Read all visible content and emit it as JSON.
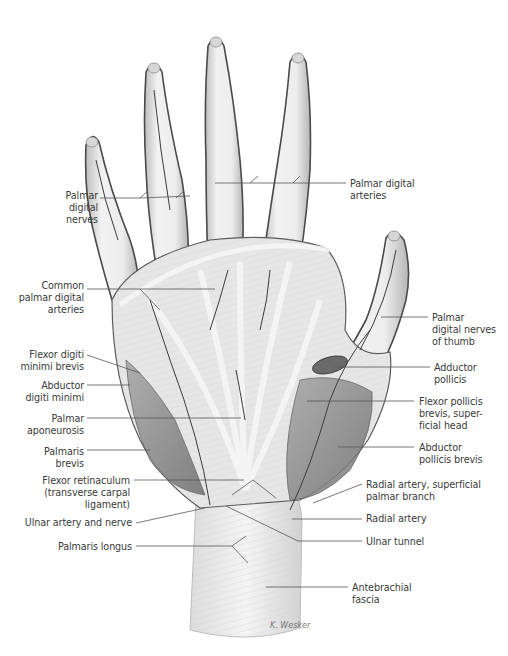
{
  "figure": {
    "type": "anatomical-illustration",
    "signature": "K. Wesker",
    "colors": {
      "label_text": "#3a3a3a",
      "leader_line": "#555555",
      "skin_tendon": "#e9e9e9",
      "outline": "#4a4a4a",
      "muscle": "#8c8c8c",
      "vessel": "#3d3d3d"
    }
  },
  "labels": {
    "left": [
      {
        "id": "palmar-digital-nerves",
        "text": "Palmar\ndigital\nnerves",
        "x": 30,
        "y": 190,
        "w": 68
      },
      {
        "id": "common-palmar-digital-arteries",
        "text": "Common\npalmar digital\narteries",
        "x": 4,
        "y": 280,
        "w": 80
      },
      {
        "id": "flexor-digiti-minimi-brevis",
        "text": "Flexor digiti\nminimi brevis",
        "x": 4,
        "y": 349,
        "w": 80
      },
      {
        "id": "abductor-digiti-minimi",
        "text": "Abductor\ndigiti minimi",
        "x": 4,
        "y": 380,
        "w": 80
      },
      {
        "id": "palmar-aponeurosis",
        "text": "Palmar\naponeurosis",
        "x": 4,
        "y": 413,
        "w": 80
      },
      {
        "id": "palmaris-brevis",
        "text": "Palmaris\nbrevis",
        "x": 4,
        "y": 446,
        "w": 80
      },
      {
        "id": "flexor-retinaculum",
        "text": "Flexor retinaculum\n(transverse carpal\nligament)",
        "x": 4,
        "y": 475,
        "w": 126
      },
      {
        "id": "ulnar-artery-and-nerve",
        "text": "Ulnar artery and nerve",
        "x": 4,
        "y": 517,
        "w": 128
      },
      {
        "id": "palmaris-longus",
        "text": "Palmaris longus",
        "x": 4,
        "y": 541,
        "w": 128
      }
    ],
    "right": [
      {
        "id": "palmar-digital-arteries",
        "text": "Palmar digital\narteries",
        "x": 350,
        "y": 178,
        "w": 110
      },
      {
        "id": "palmar-digital-nerves-of-thumb",
        "text": "Palmar\ndigital nerves\nof thumb",
        "x": 432,
        "y": 312,
        "w": 76
      },
      {
        "id": "adductor-pollicis",
        "text": "Adductor\npollicis",
        "x": 434,
        "y": 362,
        "w": 74
      },
      {
        "id": "flexor-pollicis-brevis-superficial-head",
        "text": "Flexor pollicis\nbrevis, super-\nficial head",
        "x": 419,
        "y": 396,
        "w": 89
      },
      {
        "id": "abductor-pollicis-brevis",
        "text": "Abductor\npollicis brevis",
        "x": 419,
        "y": 442,
        "w": 89
      },
      {
        "id": "radial-artery-superficial-palmar-branch",
        "text": "Radial artery, superficial\npalmar branch",
        "x": 366,
        "y": 479,
        "w": 142
      },
      {
        "id": "radial-artery",
        "text": "Radial artery",
        "x": 366,
        "y": 513,
        "w": 142
      },
      {
        "id": "ulnar-tunnel",
        "text": "Ulnar tunnel",
        "x": 366,
        "y": 536,
        "w": 142
      },
      {
        "id": "antebrachial-fascia",
        "text": "Antebrachial\nfascia",
        "x": 352,
        "y": 582,
        "w": 120
      }
    ]
  },
  "leaders": [
    {
      "for": "palmar-digital-nerves",
      "points": [
        [
          100,
          198
        ],
        [
          140,
          198
        ],
        [
          190,
          196
        ]
      ]
    },
    {
      "for": "palmar-digital-nerves-b",
      "points": [
        [
          140,
          198
        ],
        [
          148,
          191
        ]
      ]
    },
    {
      "for": "palmar-digital-nerves-c",
      "points": [
        [
          176,
          198
        ],
        [
          184,
          191
        ]
      ]
    },
    {
      "for": "palmar-digital-arteries",
      "points": [
        [
          346,
          183
        ],
        [
          215,
          183
        ]
      ]
    },
    {
      "for": "palmar-digital-arteries-b",
      "points": [
        [
          250,
          183
        ],
        [
          258,
          176
        ]
      ]
    },
    {
      "for": "palmar-digital-arteries-c",
      "points": [
        [
          293,
          183
        ],
        [
          300,
          176
        ]
      ]
    },
    {
      "for": "common-palmar-digital-arteries",
      "points": [
        [
          87,
          289
        ],
        [
          215,
          289
        ]
      ]
    },
    {
      "for": "common-palmar-digital-arteries-b",
      "points": [
        [
          140,
          289
        ],
        [
          160,
          310
        ]
      ]
    },
    {
      "for": "flexor-digiti-minimi-brevis",
      "points": [
        [
          87,
          355
        ],
        [
          140,
          373
        ]
      ]
    },
    {
      "for": "abductor-digiti-minimi",
      "points": [
        [
          87,
          385
        ],
        [
          130,
          385
        ]
      ]
    },
    {
      "for": "palmar-aponeurosis",
      "points": [
        [
          87,
          418
        ],
        [
          241,
          418
        ]
      ]
    },
    {
      "for": "palmaris-brevis",
      "points": [
        [
          87,
          450
        ],
        [
          150,
          450
        ]
      ]
    },
    {
      "for": "flexor-retinaculum",
      "points": [
        [
          134,
          480
        ],
        [
          244,
          480
        ]
      ]
    },
    {
      "for": "ulnar-artery-and-nerve",
      "points": [
        [
          136,
          523
        ],
        [
          205,
          508
        ]
      ]
    },
    {
      "for": "palmaris-longus",
      "points": [
        [
          136,
          546
        ],
        [
          232,
          546
        ]
      ]
    },
    {
      "for": "palmaris-longus-b",
      "points": [
        [
          232,
          546
        ],
        [
          246,
          536
        ]
      ]
    },
    {
      "for": "palmaris-longus-c",
      "points": [
        [
          232,
          546
        ],
        [
          248,
          563
        ]
      ]
    },
    {
      "for": "palmar-digital-nerves-of-thumb",
      "points": [
        [
          428,
          317
        ],
        [
          381,
          317
        ]
      ]
    },
    {
      "for": "adductor-pollicis",
      "points": [
        [
          430,
          367
        ],
        [
          335,
          367
        ]
      ]
    },
    {
      "for": "flexor-pollicis-brevis-superficial-head",
      "points": [
        [
          414,
          401
        ],
        [
          307,
          401
        ]
      ]
    },
    {
      "for": "abductor-pollicis-brevis",
      "points": [
        [
          414,
          447
        ],
        [
          338,
          447
        ]
      ]
    },
    {
      "for": "radial-artery-superficial-palmar-branch",
      "points": [
        [
          362,
          484
        ],
        [
          313,
          503
        ]
      ]
    },
    {
      "for": "radial-artery",
      "points": [
        [
          362,
          519
        ],
        [
          292,
          519
        ]
      ]
    },
    {
      "for": "ulnar-tunnel",
      "points": [
        [
          362,
          541
        ],
        [
          298,
          541
        ],
        [
          226,
          506
        ]
      ]
    },
    {
      "for": "antebrachial-fascia",
      "points": [
        [
          348,
          587
        ],
        [
          266,
          587
        ]
      ]
    },
    {
      "for": "flexor-retinaculum-b",
      "points": [
        [
          253,
          480
        ],
        [
          232,
          495
        ]
      ]
    },
    {
      "for": "flexor-retinaculum-c",
      "points": [
        [
          253,
          480
        ],
        [
          276,
          498
        ]
      ]
    }
  ]
}
